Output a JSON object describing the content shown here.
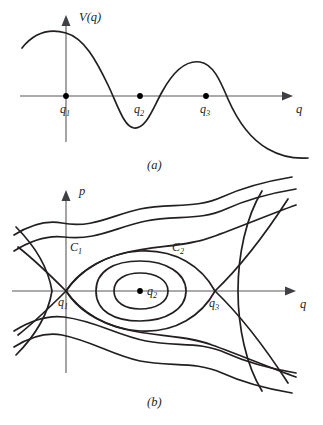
{
  "figure": {
    "width": 323,
    "height": 425,
    "background": "#ffffff",
    "curve_color": "#231f20",
    "axis_color": "#58595b"
  },
  "panel_a": {
    "caption": "(a)",
    "y_axis_label": "V(q)",
    "x_axis_label": "q",
    "points": [
      {
        "label_base": "q",
        "label_sub": "1",
        "x": 66,
        "y": 96,
        "role": "local-maximum"
      },
      {
        "label_base": "q",
        "label_sub": "2",
        "x": 140,
        "y": 96,
        "role": "local-minimum"
      },
      {
        "label_base": "q",
        "label_sub": "3",
        "x": 206,
        "y": 96,
        "role": "local-maximum"
      }
    ],
    "curve_description": "potential energy V(q): rises to a maximum at q1, falls to a minimum past q2, rises to a second maximum near q3, then falls off to the right",
    "curve_path": "M 22,48 C 34,33 48,28 66,33 C 84,38 96,60 108,85 C 118,106 124,127 134,128 C 146,129 152,110 162,92 C 174,70 186,60 200,62 C 213,64 220,80 228,99 C 238,122 252,140 268,149 C 282,157 295,159 308,158",
    "axes": {
      "x_line": {
        "x1": 20,
        "y1": 96,
        "x2": 285,
        "y2": 96
      },
      "y_line": {
        "x1": 66,
        "y1": 140,
        "x2": 66,
        "y2": 22
      }
    }
  },
  "panel_b": {
    "caption": "(b)",
    "y_axis_label": "p",
    "x_axis_label": "q",
    "points": [
      {
        "label_base": "q",
        "label_sub": "1",
        "x": 66,
        "y": 116,
        "role": "saddle-point"
      },
      {
        "label_base": "q",
        "label_sub": "2",
        "x": 140,
        "y": 116,
        "role": "center"
      },
      {
        "label_base": "q",
        "label_sub": "3",
        "x": 215,
        "y": 116,
        "role": "saddle-point"
      }
    ],
    "curve_labels": [
      {
        "label_base": "C",
        "label_sub": "1",
        "x": 74,
        "y": 72,
        "role": "separatrix-through-q1"
      },
      {
        "label_base": "C",
        "label_sub": "2",
        "x": 176,
        "y": 72,
        "role": "separatrix-through-q3"
      }
    ],
    "axes": {
      "x_line": {
        "x1": 12,
        "y1": 116,
        "x2": 288,
        "y2": 116
      },
      "y_line": {
        "x1": 66,
        "y1": 196,
        "x2": 66,
        "y2": 22
      }
    },
    "trajectories": [
      {
        "name": "outer-upper-1",
        "d": "M 14,60 C 30,50 46,45 62,48 C 92,54 112,40 140,34 C 170,28 196,34 222,22 C 244,12 268,6 292,2"
      },
      {
        "name": "outer-upper-2",
        "d": "M 14,76 C 30,66 48,60 64,62 C 96,66 116,52 146,46 C 176,40 200,46 226,34 C 248,24 272,18 296,14"
      },
      {
        "name": "separatrix-c1-upper",
        "d": "M 66,116 C 76,100 94,86 124,78 C 156,70 186,72 212,62 C 240,52 268,40 296,30"
      },
      {
        "name": "separatrix-c2-upper",
        "d": "M 66,116 C 80,96 106,78 140,76 C 176,74 202,92 215,116"
      },
      {
        "name": "closed-orbit-outer",
        "d": "M 96,116 C 96,96 114,86 140,86 C 166,86 186,98 186,116 C 186,134 166,146 140,146 C 114,146 96,136 96,116 Z"
      },
      {
        "name": "closed-orbit-inner",
        "d": "M 114,116 C 114,104 126,98 140,98 C 156,98 168,105 168,116 C 168,127 156,134 140,134 C 126,134 114,128 114,116 Z"
      },
      {
        "name": "separatrix-c2-lower",
        "d": "M 66,116 C 80,136 106,154 140,156 C 176,158 202,140 215,116"
      },
      {
        "name": "separatrix-c1-lower",
        "d": "M 66,116 C 76,132 94,146 124,154 C 156,162 186,160 212,170 C 240,180 268,192 296,202"
      },
      {
        "name": "outer-lower-2",
        "d": "M 14,156 C 30,146 48,140 64,142 C 96,146 116,160 146,166 C 176,172 200,166 226,178 C 248,188 272,194 296,198"
      },
      {
        "name": "outer-lower-1",
        "d": "M 14,172 C 30,162 46,157 62,160 C 92,166 112,180 140,186 C 170,192 196,186 222,198 C 244,208 268,214 292,218"
      },
      {
        "name": "left-hyperbola-branch",
        "d": "M 16,52 C 34,70 48,92 52,116 C 48,140 34,162 16,180"
      },
      {
        "name": "right-hyperbola-branch",
        "d": "M 262,16 C 246,42 238,80 238,116 C 238,152 246,190 262,216"
      },
      {
        "name": "left-asymptote-upper",
        "d": "M 66,116 C 52,102 36,86 18,72"
      },
      {
        "name": "left-asymptote-lower",
        "d": "M 66,116 C 52,130 36,146 18,160"
      },
      {
        "name": "right-asymptote-upper",
        "d": "M 215,116 C 240,92 266,58 288,24"
      },
      {
        "name": "right-asymptote-lower",
        "d": "M 215,116 C 240,140 266,174 288,208"
      }
    ]
  }
}
